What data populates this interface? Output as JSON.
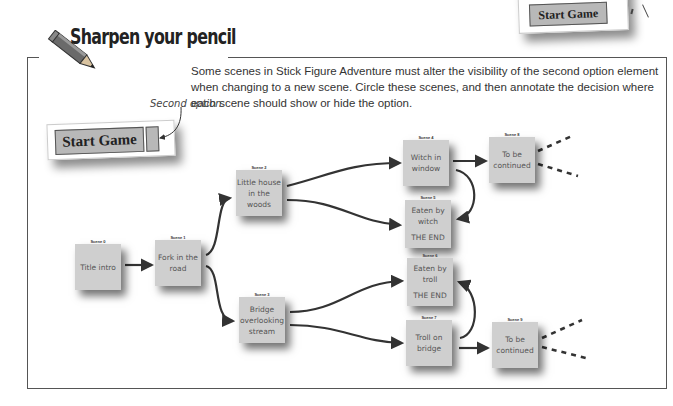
{
  "header": {
    "title": "Sharpen your pencil",
    "instructions": "Some scenes in Stick Figure Adventure must alter the visibility of the second option element when changing to a new scene. Circle these scenes, and then annotate the decision where each scene should show or hide the option."
  },
  "top_card": {
    "button_label": "Start Game"
  },
  "example": {
    "annotation": "Second option.",
    "button_label": "Start Game"
  },
  "scenes": [
    {
      "id": "Scene 0",
      "text": "Title intro",
      "end": ""
    },
    {
      "id": "Scene 1",
      "text": "Fork in the road",
      "end": ""
    },
    {
      "id": "Scene 2",
      "text": "Little house in the woods",
      "end": ""
    },
    {
      "id": "Scene 3",
      "text": "Bridge overlooking stream",
      "end": ""
    },
    {
      "id": "Scene 4",
      "text": "Witch in window",
      "end": ""
    },
    {
      "id": "Scene 5",
      "text": "Eaten by witch",
      "end": "THE END"
    },
    {
      "id": "Scene 6",
      "text": "Eaten by troll",
      "end": "THE END"
    },
    {
      "id": "Scene 7",
      "text": "Troll on bridge",
      "end": ""
    },
    {
      "id": "Scene 8",
      "text": "To be continued",
      "end": ""
    },
    {
      "id": "Scene 9",
      "text": "To be continued",
      "end": ""
    }
  ],
  "colors": {
    "note": "#cfcfcf",
    "button": "#b8b8b8",
    "line": "#333333"
  }
}
